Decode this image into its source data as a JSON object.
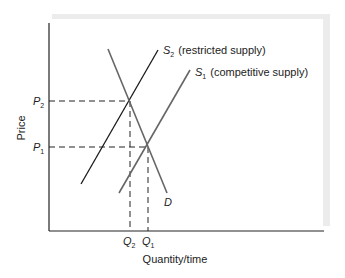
{
  "diagram": {
    "type": "supply-demand",
    "axes": {
      "y_label": "Price",
      "x_label": "Quantity/time"
    },
    "curves": [
      {
        "id": "S2",
        "symbol": "S",
        "subscript": "2",
        "description": "(restricted supply)"
      },
      {
        "id": "S1",
        "symbol": "S",
        "subscript": "1",
        "description": "(competitive supply)"
      },
      {
        "id": "D",
        "symbol": "D",
        "subscript": "",
        "description": ""
      }
    ],
    "price_ticks": [
      {
        "symbol": "P",
        "subscript": "2"
      },
      {
        "symbol": "P",
        "subscript": "1"
      }
    ],
    "quantity_ticks": [
      {
        "symbol": "Q",
        "subscript": "2"
      },
      {
        "symbol": "Q",
        "subscript": "1"
      }
    ],
    "colors": {
      "axis": "#222222",
      "s2_line": "#1a1a1a",
      "s1_line": "#666666",
      "d_line": "#666666",
      "panel_shadow": "#e8e8e8"
    }
  }
}
